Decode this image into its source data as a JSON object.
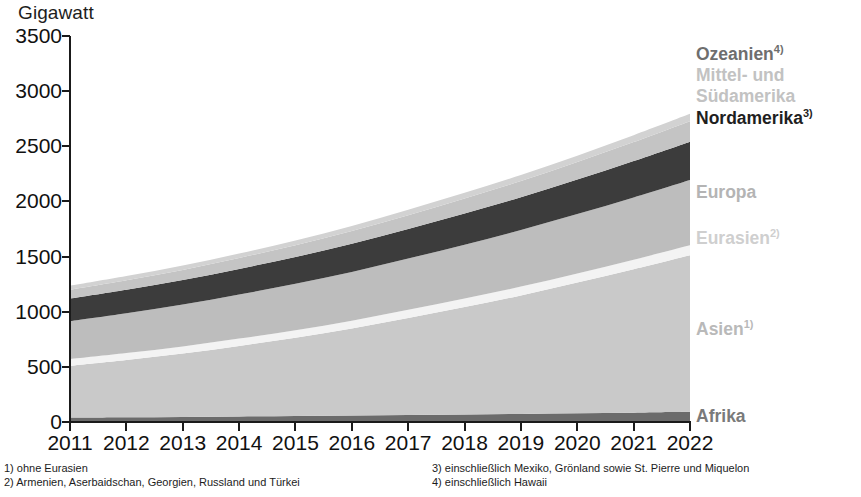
{
  "axis": {
    "unit_title": "Gigawatt",
    "y_ticks": [
      "0",
      "500",
      "1000",
      "1500",
      "2000",
      "2500",
      "3000",
      "3500"
    ],
    "y_min": 0,
    "y_max": 3500,
    "x_ticks": [
      "2011",
      "2012",
      "2013",
      "2014",
      "2015",
      "2016",
      "2017",
      "2018",
      "2019",
      "2020",
      "2021",
      "2022"
    ]
  },
  "legend": {
    "items": [
      {
        "label": "Ozeanien",
        "sup": "4)",
        "color": "#6e6e6e",
        "top": 0
      },
      {
        "label": "Mittel- und",
        "sup": "",
        "color": "#c2c2c2",
        "top": 21
      },
      {
        "label": "Südamerika",
        "sup": "",
        "color": "#c2c2c2",
        "top": 42
      },
      {
        "label": "Nordamerika",
        "sup": "3)",
        "color": "#1f1f1f",
        "top": 64
      },
      {
        "label": "Europa",
        "sup": "",
        "color": "#b4b4b4",
        "top": 138
      },
      {
        "label": "Eurasien",
        "sup": "2)",
        "color": "#cfcfcf",
        "top": 184
      },
      {
        "label": "Asien",
        "sup": "1)",
        "color": "#b9b9b9",
        "top": 275
      },
      {
        "label": "Afrika",
        "sup": "",
        "color": "#7a7a7a",
        "top": 362
      }
    ]
  },
  "footnotes": {
    "left": [
      "1) ohne Eurasien",
      "2) Armenien, Aserbaidschan, Georgien, Russland und Türkei"
    ],
    "right": [
      "3) einschließlich Mexiko, Grönland sowie St. Pierre und Miquelon",
      "4) einschließlich Hawaii"
    ]
  },
  "colors": {
    "afrika": "#6b6b6b",
    "asien": "#c9c9c9",
    "eurasien": "#f3f3f3",
    "europa": "#bdbdbd",
    "nordamerika": "#3c3c3c",
    "mittel_suedamerika": "#c4c4c4",
    "ozeanien": "#d2d2d2",
    "axis": "#1a1a1a",
    "background": "#ffffff"
  },
  "chart_data": {
    "type": "area",
    "title": "",
    "subtitle": "",
    "xlabel": "",
    "ylabel": "Gigawatt",
    "ylim": [
      0,
      3500
    ],
    "grid": false,
    "legend_position": "right",
    "stacked": true,
    "x": [
      "2011",
      "2012",
      "2013",
      "2014",
      "2015",
      "2016",
      "2017",
      "2018",
      "2019",
      "2020",
      "2021",
      "2022"
    ],
    "series": [
      {
        "name": "Afrika",
        "values": [
          40,
          43,
          46,
          50,
          54,
          58,
          63,
          68,
          73,
          79,
          85,
          92
        ]
      },
      {
        "name": "Asien",
        "values": [
          470,
          520,
          575,
          640,
          710,
          790,
          880,
          975,
          1075,
          1185,
          1300,
          1420
        ]
      },
      {
        "name": "Eurasien",
        "values": [
          60,
          62,
          64,
          66,
          69,
          71,
          74,
          77,
          80,
          83,
          86,
          90
        ]
      },
      {
        "name": "Europa",
        "values": [
          345,
          362,
          380,
          400,
          420,
          442,
          465,
          488,
          513,
          538,
          565,
          592
        ]
      },
      {
        "name": "Nordamerika",
        "values": [
          205,
          213,
          222,
          232,
          243,
          255,
          268,
          282,
          297,
          313,
          330,
          348
        ]
      },
      {
        "name": "Mittel- und Südamerika",
        "values": [
          80,
          86,
          92,
          99,
          107,
          116,
          125,
          136,
          147,
          159,
          172,
          186
        ]
      },
      {
        "name": "Ozeanien",
        "values": [
          35,
          37,
          39,
          41,
          43,
          46,
          49,
          52,
          55,
          58,
          62,
          66
        ]
      }
    ],
    "totals": [
      1235,
      1323,
      1418,
      1528,
      1646,
      1778,
      1924,
      2078,
      2240,
      2415,
      2600,
      2794
    ]
  }
}
